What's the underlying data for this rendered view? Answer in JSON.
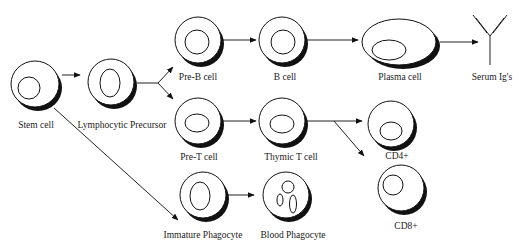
{
  "diagram": {
    "type": "cell-lineage-flow",
    "nodes": [
      {
        "id": "stem",
        "label": "Stem cell"
      },
      {
        "id": "lymph",
        "label": "Lymphocytic Precursor"
      },
      {
        "id": "preb",
        "label": "Pre-B cell"
      },
      {
        "id": "bcell",
        "label": "B cell"
      },
      {
        "id": "plasma",
        "label": "Plasma cell"
      },
      {
        "id": "serum",
        "label": "Serum Ig's"
      },
      {
        "id": "pret",
        "label": "Pre-T cell"
      },
      {
        "id": "thymic",
        "label": "Thymic T cell"
      },
      {
        "id": "cd4",
        "label": "CD4+"
      },
      {
        "id": "cd8",
        "label": "CD8+"
      },
      {
        "id": "immphago",
        "label": "Immature Phagocyte"
      },
      {
        "id": "bloodphago",
        "label": "Blood Phagocyte"
      }
    ],
    "edges": [
      {
        "from": "stem",
        "to": "lymph"
      },
      {
        "from": "stem",
        "to": "immphago"
      },
      {
        "from": "lymph",
        "to": "preb"
      },
      {
        "from": "lymph",
        "to": "pret"
      },
      {
        "from": "preb",
        "to": "bcell"
      },
      {
        "from": "bcell",
        "to": "plasma"
      },
      {
        "from": "plasma",
        "to": "serum"
      },
      {
        "from": "pret",
        "to": "thymic"
      },
      {
        "from": "thymic",
        "to": "cd4"
      },
      {
        "from": "thymic",
        "to": "cd8"
      },
      {
        "from": "immphago",
        "to": "bloodphago"
      }
    ]
  }
}
